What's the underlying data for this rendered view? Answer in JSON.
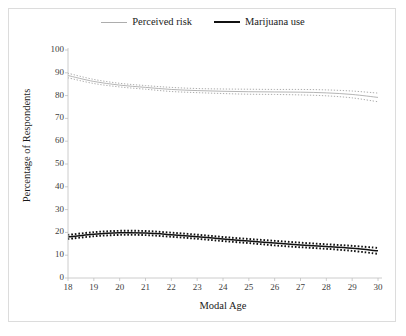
{
  "legend": {
    "position": "top-center",
    "entries": [
      {
        "label": "Perceived risk",
        "color": "#adadad",
        "style": "thin-solid"
      },
      {
        "label": "Marijuana use",
        "color": "#111111",
        "style": "thick-solid"
      }
    ]
  },
  "axes": {
    "xlabel": "Modal Age",
    "ylabel": "Percentage of Respondents",
    "xticks": [
      "18",
      "19",
      "20",
      "21",
      "22",
      "23",
      "24",
      "25",
      "26",
      "27",
      "28",
      "29",
      "30"
    ],
    "yticks": [
      "100",
      "90",
      "80",
      "70",
      "60",
      "50",
      "40",
      "30",
      "20",
      "10",
      "0"
    ]
  },
  "chart_data": {
    "type": "line",
    "title": "",
    "xlabel": "Modal Age",
    "ylabel": "Percentage of Respondents",
    "xlim": [
      18,
      30
    ],
    "ylim": [
      0,
      100
    ],
    "grid": false,
    "legend_position": "top-center",
    "x": [
      18,
      19,
      20,
      21,
      22,
      23,
      24,
      25,
      26,
      27,
      28,
      29,
      30
    ],
    "series": [
      {
        "name": "Perceived risk",
        "color": "#adadad",
        "linestyle": "solid",
        "values": [
          88.8,
          86.2,
          84.6,
          83.6,
          82.7,
          82.2,
          81.9,
          81.7,
          81.6,
          81.5,
          81.2,
          80.5,
          79.2
        ],
        "ci_upper": [
          89.8,
          87.1,
          85.4,
          84.4,
          83.6,
          83.1,
          82.9,
          82.8,
          82.7,
          82.7,
          82.5,
          82.0,
          81.1
        ],
        "ci_lower": [
          87.8,
          85.3,
          83.8,
          82.8,
          81.8,
          81.3,
          80.9,
          80.6,
          80.5,
          80.3,
          79.9,
          79.0,
          77.3
        ],
        "ci_style": "dotted"
      },
      {
        "name": "Marijuana use",
        "color": "#111111",
        "linestyle": "solid",
        "values": [
          18.0,
          19.2,
          19.8,
          19.7,
          19.0,
          18.1,
          17.1,
          16.2,
          15.3,
          14.5,
          13.8,
          13.0,
          11.9
        ],
        "ci_upper": [
          18.9,
          20.1,
          20.7,
          20.6,
          19.9,
          19.0,
          18.0,
          17.1,
          16.3,
          15.5,
          14.8,
          14.1,
          13.2
        ],
        "ci_lower": [
          17.1,
          18.3,
          18.9,
          18.8,
          18.1,
          17.2,
          16.2,
          15.3,
          14.3,
          13.5,
          12.8,
          11.9,
          10.6
        ],
        "ci_style": "dotted"
      }
    ]
  }
}
